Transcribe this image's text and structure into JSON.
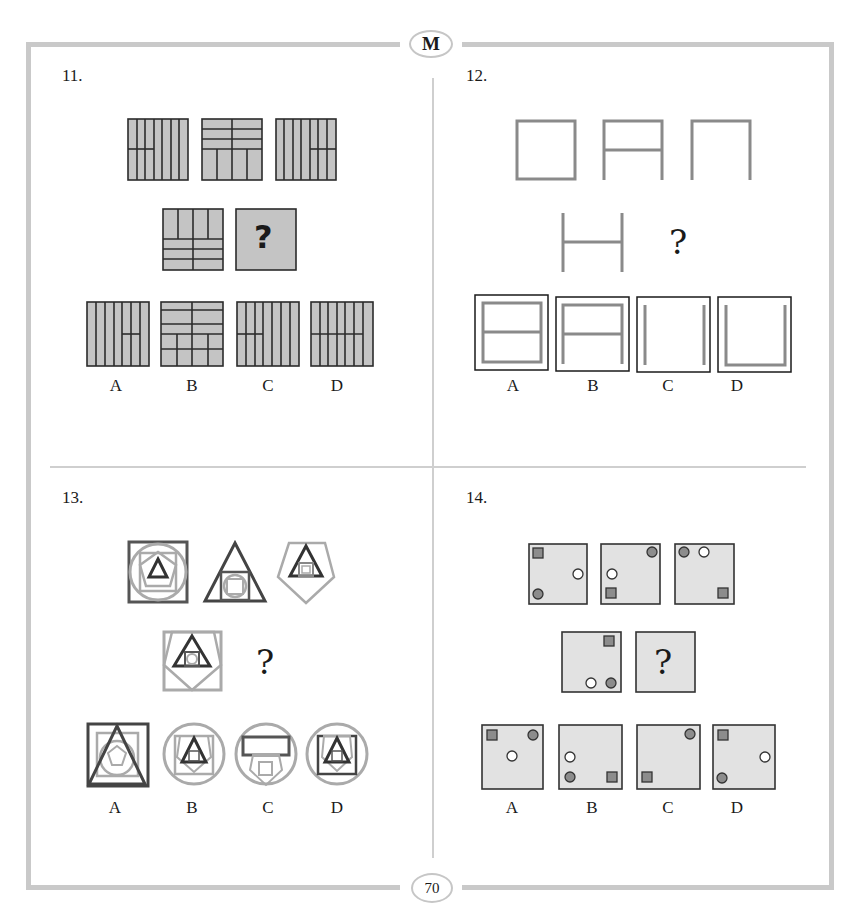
{
  "page": {
    "section_badge": "M",
    "page_number": "70"
  },
  "puzzles": [
    {
      "number": "11.",
      "type": "tile-stripe-pattern",
      "question_mark": "?",
      "options": [
        "A",
        "B",
        "C",
        "D"
      ]
    },
    {
      "number": "12.",
      "type": "square-segment-removal",
      "question_mark": "?",
      "options": [
        "A",
        "B",
        "C",
        "D"
      ]
    },
    {
      "number": "13.",
      "type": "nested-shapes",
      "question_mark": "?",
      "options": [
        "A",
        "B",
        "C",
        "D"
      ]
    },
    {
      "number": "14.",
      "type": "dot-square-positions",
      "question_mark": "?",
      "options": [
        "A",
        "B",
        "C",
        "D"
      ]
    }
  ],
  "colors": {
    "frame_border": "#c9c9c9",
    "tile_fill": "#c4c4c4",
    "tile_stroke": "#2b2b2b",
    "shape_gray": "#8a8a8a",
    "light_fill": "#e2e2e2",
    "dark_dot": "#8c8c8c"
  }
}
